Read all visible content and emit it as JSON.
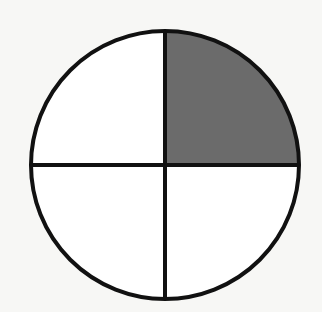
{
  "diagram": {
    "type": "fraction-circle",
    "parts_total": 4,
    "parts_shaded": 1,
    "fraction": "1/4",
    "shaded_quadrant": "top-right",
    "colors": {
      "background": "#f7f7f5",
      "stroke": "#111111",
      "shaded_fill": "#6b6b6b",
      "unshaded_fill": "#ffffff"
    },
    "geometry": {
      "cx": 165,
      "cy": 165,
      "r": 134,
      "stroke_width": 4
    }
  }
}
